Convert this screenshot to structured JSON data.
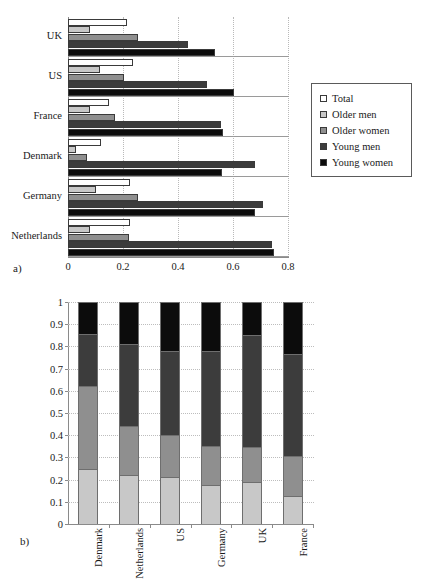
{
  "figure": {
    "panel_a_label": "a)",
    "panel_b_label": "b)"
  },
  "legend": {
    "position": "right",
    "items": [
      {
        "label": "Total",
        "color": "#ffffff",
        "key": "total"
      },
      {
        "label": "Older men",
        "color": "#c8c8c8",
        "key": "older_men"
      },
      {
        "label": "Older women",
        "color": "#8f8f8f",
        "key": "older_women"
      },
      {
        "label": "Young men",
        "color": "#3c3c3c",
        "key": "young_men"
      },
      {
        "label": "Young women",
        "color": "#0c0c0c",
        "key": "young_women"
      }
    ]
  },
  "chart_data": [
    {
      "panel": "a",
      "type": "bar",
      "orientation": "horizontal",
      "title": "",
      "xlabel": "",
      "ylabel": "",
      "xlim": [
        0,
        0.8
      ],
      "xticks": [
        "0",
        "0.2",
        "0.4",
        "0.6",
        "0.8"
      ],
      "xtick_values": [
        0,
        0.2,
        0.4,
        0.6,
        0.8
      ],
      "grid": true,
      "legend": [
        "Total",
        "Older men",
        "Older women",
        "Young men",
        "Young women"
      ],
      "categories": [
        "UK",
        "US",
        "France",
        "Denmark",
        "Germany",
        "Netherlands"
      ],
      "series": [
        {
          "name": "Total",
          "values": [
            0.215,
            0.235,
            0.15,
            0.12,
            0.225,
            0.225
          ]
        },
        {
          "name": "Older men",
          "values": [
            0.08,
            0.115,
            0.08,
            0.03,
            0.1,
            0.08
          ]
        },
        {
          "name": "Older women",
          "values": [
            0.255,
            0.205,
            0.17,
            0.07,
            0.255,
            0.22
          ]
        },
        {
          "name": "Young men",
          "values": [
            0.435,
            0.505,
            0.555,
            0.68,
            0.71,
            0.74
          ]
        },
        {
          "name": "Young women",
          "values": [
            0.535,
            0.605,
            0.565,
            0.56,
            0.68,
            0.75
          ]
        }
      ]
    },
    {
      "panel": "b",
      "type": "bar",
      "subtype": "stacked",
      "orientation": "vertical",
      "title": "",
      "xlabel": "",
      "ylabel": "",
      "ylim": [
        0,
        1
      ],
      "yticks": [
        "0",
        "0.1",
        "0.2",
        "0.3",
        "0.4",
        "0.5",
        "0.6",
        "0.7",
        "0.8",
        "0.9",
        "1"
      ],
      "ytick_values": [
        0,
        0.1,
        0.2,
        0.3,
        0.4,
        0.5,
        0.6,
        0.7,
        0.8,
        0.9,
        1
      ],
      "grid": true,
      "categories": [
        "Denmark",
        "Netherlands",
        "US",
        "Germany",
        "UK",
        "France"
      ],
      "series": [
        {
          "name": "Older men",
          "color": "#c8c8c8",
          "values": [
            0.25,
            0.22,
            0.21,
            0.175,
            0.19,
            0.125
          ]
        },
        {
          "name": "Older women",
          "color": "#8f8f8f",
          "values": [
            0.37,
            0.22,
            0.19,
            0.175,
            0.155,
            0.18
          ]
        },
        {
          "name": "Young men",
          "color": "#3c3c3c",
          "values": [
            0.235,
            0.37,
            0.38,
            0.43,
            0.505,
            0.46
          ]
        },
        {
          "name": "Young women",
          "color": "#0c0c0c",
          "values": [
            0.145,
            0.19,
            0.22,
            0.22,
            0.15,
            0.235
          ]
        }
      ],
      "cumulative_boundaries": [
        [
          0.25,
          0.62,
          0.855,
          1.0
        ],
        [
          0.22,
          0.44,
          0.81,
          1.0
        ],
        [
          0.21,
          0.4,
          0.78,
          1.0
        ],
        [
          0.175,
          0.35,
          0.78,
          1.0
        ],
        [
          0.19,
          0.345,
          0.85,
          1.0
        ],
        [
          0.125,
          0.305,
          0.765,
          1.0
        ]
      ]
    }
  ]
}
